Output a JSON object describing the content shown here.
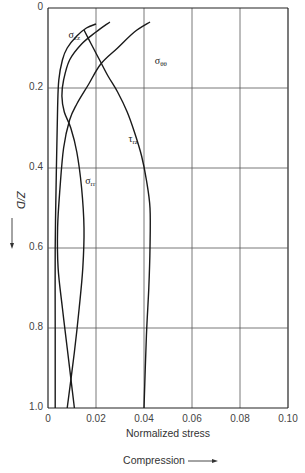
{
  "chart_data": {
    "type": "line",
    "title": "",
    "xlabel": "Normalized stress",
    "xlabel_note": "Compression",
    "ylabel": "Z/D",
    "xlim": [
      0,
      0.1
    ],
    "ylim": [
      0,
      1.0
    ],
    "y_inverted": true,
    "grid": true,
    "x_ticks": [
      "0",
      "0.02",
      "0.04",
      "0.06",
      "0.08",
      "0.10"
    ],
    "y_ticks": [
      "0",
      "0.2",
      "0.4",
      "0.6",
      "0.8",
      "1.0"
    ],
    "series": [
      {
        "name": "σzz",
        "label_main": "σ",
        "label_sub": "zz",
        "points": [
          [
            0.02,
            0.04
          ],
          [
            0.016,
            0.05
          ],
          [
            0.012,
            0.07
          ],
          [
            0.008,
            0.1
          ],
          [
            0.006,
            0.13
          ],
          [
            0.0045,
            0.18
          ],
          [
            0.004,
            0.25
          ],
          [
            0.0035,
            0.4
          ],
          [
            0.003,
            0.6
          ],
          [
            0.003,
            0.8
          ],
          [
            0.003,
            1.0
          ]
        ]
      },
      {
        "name": "σrr",
        "label_main": "σ",
        "label_sub": "rr",
        "points": [
          [
            0.0258,
            0.035
          ],
          [
            0.02,
            0.06
          ],
          [
            0.014,
            0.09
          ],
          [
            0.009,
            0.13
          ],
          [
            0.0065,
            0.18
          ],
          [
            0.0058,
            0.22
          ],
          [
            0.0068,
            0.26
          ],
          [
            0.0095,
            0.3
          ],
          [
            0.012,
            0.36
          ],
          [
            0.014,
            0.45
          ],
          [
            0.015,
            0.55
          ],
          [
            0.0145,
            0.65
          ],
          [
            0.013,
            0.75
          ],
          [
            0.011,
            0.86
          ],
          [
            0.008,
            1.0
          ]
        ]
      },
      {
        "name": "σθθ",
        "label_main": "σ",
        "label_sub": "θθ",
        "points": [
          [
            0.0425,
            0.035
          ],
          [
            0.036,
            0.06
          ],
          [
            0.029,
            0.1
          ],
          [
            0.022,
            0.14
          ],
          [
            0.017,
            0.19
          ],
          [
            0.012,
            0.24
          ],
          [
            0.009,
            0.28
          ],
          [
            0.0065,
            0.35
          ],
          [
            0.005,
            0.45
          ],
          [
            0.004,
            0.55
          ],
          [
            0.0042,
            0.65
          ],
          [
            0.006,
            0.75
          ],
          [
            0.008,
            0.85
          ],
          [
            0.011,
            1.0
          ]
        ]
      },
      {
        "name": "τrz",
        "label_main": "τ",
        "label_sub": "rz",
        "points": [
          [
            0.015,
            0.055
          ],
          [
            0.018,
            0.09
          ],
          [
            0.0215,
            0.13
          ],
          [
            0.025,
            0.17
          ],
          [
            0.029,
            0.21
          ],
          [
            0.033,
            0.26
          ],
          [
            0.036,
            0.31
          ],
          [
            0.039,
            0.37
          ],
          [
            0.041,
            0.43
          ],
          [
            0.0425,
            0.5
          ],
          [
            0.0425,
            0.6
          ],
          [
            0.042,
            0.7
          ],
          [
            0.041,
            0.82
          ],
          [
            0.04,
            1.0
          ]
        ]
      }
    ],
    "label_positions": {
      "σzz": [
        0.0085,
        0.075
      ],
      "σθθ": [
        0.0445,
        0.14
      ],
      "τrz": [
        0.0335,
        0.335
      ],
      "σrr": [
        0.0155,
        0.44
      ]
    }
  }
}
